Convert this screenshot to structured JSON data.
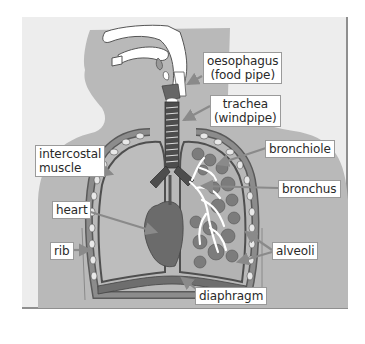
{
  "diagram": {
    "title": "",
    "colors": {
      "panel_bg": "#ededed",
      "body_silhouette": "#b9b9b9",
      "lung_fill": "#bdbdbd",
      "lung_outline": "#555555",
      "heart": "#6e6e6e",
      "alveoli": "#7c7c7c",
      "airway_white": "#ffffff",
      "label_border": "#9a9a9a",
      "arrow": "#8a8a8a"
    },
    "labels": {
      "oesophagus": {
        "line1": "oesophagus",
        "line2": "(food pipe)"
      },
      "trachea": {
        "line1": "trachea",
        "line2": "(windpipe)"
      },
      "bronchiole": "bronchiole",
      "intercostal_muscle": {
        "line1": "intercostal",
        "line2": "muscle"
      },
      "bronchus": "bronchus",
      "heart": "heart",
      "rib": "rib",
      "alveoli": "alveoli",
      "diaphragm": "diaphragm"
    }
  }
}
